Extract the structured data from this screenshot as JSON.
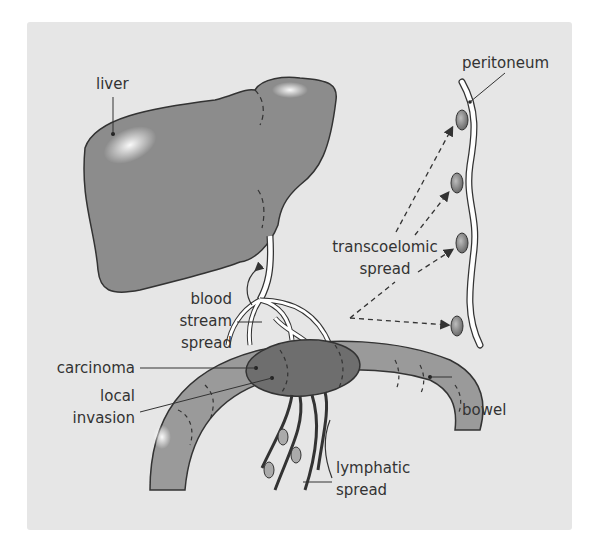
{
  "diagram": {
    "labels": {
      "liver": "liver",
      "peritoneum": "peritoneum",
      "transcoelomic_line1": "transcoelomic",
      "transcoelomic_line2": "spread",
      "blood_line1": "blood",
      "blood_line2": "stream",
      "blood_line3": "spread",
      "carcinoma": "carcinoma",
      "local_line1": "local",
      "local_line2": "invasion",
      "bowel": "bowel",
      "lymphatic_line1": "lymphatic",
      "lymphatic_line2": "spread"
    },
    "colors": {
      "background": "#e6e6e6",
      "organ": "#8c8c8c",
      "bowel": "#9a9a9a",
      "carcinoma": "#6e6e6e",
      "outline": "#333333",
      "vessels": "#ffffff"
    }
  }
}
